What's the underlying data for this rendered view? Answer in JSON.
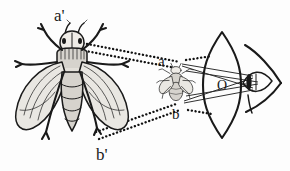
{
  "figure": {
    "domain_kind": "diagram",
    "background_color": "#fdfdfd",
    "ink_color": "#1a1a1a",
    "width": 290,
    "height": 171
  },
  "labels": {
    "object_top": "a",
    "object_bottom": "b",
    "image_top": "a'",
    "image_bottom": "b'",
    "lens_center": "O"
  },
  "elements": {
    "large_fly_name": "magnified virtual image of fly",
    "small_fly_name": "actual fly object",
    "lens_name": "biconvex converging lens",
    "eye_name": "observer eye"
  },
  "geometry": {
    "lens_center_x": 222,
    "lens_center_y": 85,
    "lens_half_height": 53,
    "lens_half_width": 19,
    "object_top_point": [
      176,
      66
    ],
    "object_bottom_point": [
      176,
      104
    ],
    "image_top_point": [
      63,
      32
    ],
    "image_bottom_point": [
      100,
      139
    ],
    "eye_x": 262,
    "eye_y": 83
  },
  "colors": {
    "ink": "#1a1a1a",
    "ray_solid": "#262626",
    "ray_dotted": "#111111",
    "wing": "#e9e7e2",
    "body": "#d6d3cd",
    "background": "#fdfdfd"
  }
}
